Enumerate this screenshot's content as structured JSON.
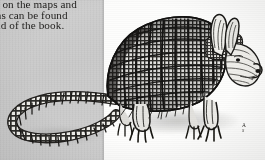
{
  "page": {
    "kind": "scanned-book-page",
    "background_color": "#fdfdfc"
  },
  "panel": {
    "name": "gray-text-panel",
    "color": "#c8c8c8",
    "width_px": 104,
    "body_text": {
      "line1": "es on the maps and",
      "line2": "ons can be found",
      "line3": "end of the book.",
      "note": "left edge of each line is cropped by the image border"
    }
  },
  "illustration": {
    "subject": "armadillo",
    "description": "pen-and-ink engraving of a nine-banded armadillo in profile facing right, with banded carapace, long segmented tail curving to the left, clawed feet and large upright ears",
    "ink_color": "#2b2a27",
    "paper_color": "#fbfbfa",
    "band_count": 9
  },
  "caption": {
    "name": "figure-caption",
    "line1": "A",
    "line2": "S",
    "note": "caption text is clipped at the right edge of the screenshot"
  }
}
